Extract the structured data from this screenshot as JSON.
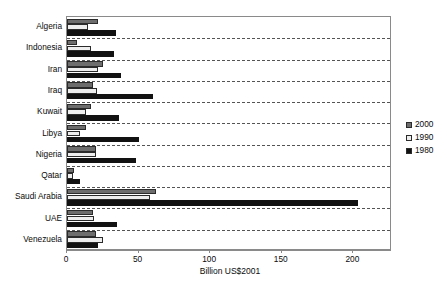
{
  "chart_data": {
    "type": "bar",
    "orientation": "horizontal",
    "title": "",
    "xlabel": "Billion US$2001",
    "ylabel": "",
    "xlim": [
      0,
      227
    ],
    "xticks": [
      0,
      50,
      100,
      150,
      200
    ],
    "xtick_labels": [
      "0",
      "50",
      "100",
      "150",
      "200"
    ],
    "grid": "horizontal-dashed-separators",
    "legend_position": "right",
    "categories": [
      "Algeria",
      "Indonesia",
      "Iran",
      "Iraq",
      "Kuwait",
      "Libya",
      "Nigeria",
      "Qatar",
      "Saudi Arabia",
      "UAE",
      "Venezuela"
    ],
    "series": [
      {
        "name": "2000",
        "color": "#6d6d6d",
        "values": [
          22,
          7,
          25,
          18,
          17,
          13,
          20,
          5,
          62,
          18,
          20
        ]
      },
      {
        "name": "1990",
        "color": "#eeeeee",
        "values": [
          15,
          17,
          22,
          21,
          13,
          9,
          20,
          4,
          58,
          19,
          25
        ]
      },
      {
        "name": "1980",
        "color": "#121212",
        "values": [
          34,
          33,
          38,
          60,
          36,
          50,
          48,
          9,
          203,
          35,
          22
        ]
      }
    ]
  },
  "legend": {
    "items": [
      {
        "label": "2000",
        "swatch": "#6d6d6d"
      },
      {
        "label": "1990",
        "swatch": "#eeeeee"
      },
      {
        "label": "1980",
        "swatch": "#121212"
      }
    ]
  },
  "axis": {
    "x_title": "Billion US$2001"
  }
}
